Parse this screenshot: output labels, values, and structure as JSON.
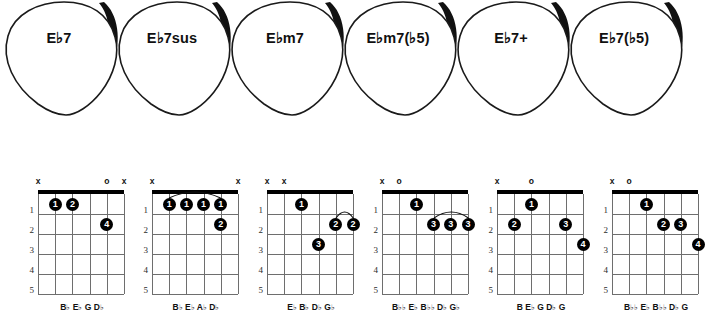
{
  "picks": [
    {
      "name": "pick-eb7",
      "label": "E♭7"
    },
    {
      "name": "pick-eb7sus",
      "label": "E♭7sus"
    },
    {
      "name": "pick-ebm7",
      "label": "E♭m7"
    },
    {
      "name": "pick-ebm7b5",
      "label": "E♭m7(♭5)"
    },
    {
      "name": "pick-eb7aug",
      "label": "E♭7+"
    },
    {
      "name": "pick-eb7b5",
      "label": "E♭7(♭5)"
    }
  ],
  "fret_numbers": [
    "1",
    "2",
    "3",
    "4",
    "5"
  ],
  "diagrams": [
    {
      "name": "chord-diagram-eb7",
      "chord": "E♭7",
      "markers": [
        "x",
        "",
        "",
        "",
        "o",
        "x"
      ],
      "dots": [
        {
          "string": 5,
          "fret": 1,
          "finger": "1"
        },
        {
          "string": 4,
          "fret": 1,
          "finger": "2"
        },
        {
          "string": 2,
          "fret": 2,
          "finger": "4"
        }
      ],
      "barre": null,
      "notes": [
        "B♭",
        "E♭",
        "G",
        "D♭"
      ]
    },
    {
      "name": "chord-diagram-eb7sus",
      "chord": "E♭7sus",
      "markers": [
        "x",
        "",
        "",
        "",
        "",
        "x"
      ],
      "dots": [
        {
          "string": 5,
          "fret": 1,
          "finger": "1"
        },
        {
          "string": 4,
          "fret": 1,
          "finger": "1"
        },
        {
          "string": 3,
          "fret": 1,
          "finger": "1"
        },
        {
          "string": 2,
          "fret": 1,
          "finger": "1"
        },
        {
          "string": 2,
          "fret": 2,
          "finger": "2"
        }
      ],
      "barre": {
        "fret": 1,
        "from_string": 5,
        "to_string": 2
      },
      "notes": [
        "B♭",
        "E♭",
        "A♭",
        "D♭"
      ]
    },
    {
      "name": "chord-diagram-ebm7",
      "chord": "E♭m7",
      "markers": [
        "x",
        "x",
        "",
        "",
        "",
        ""
      ],
      "dots": [
        {
          "string": 4,
          "fret": 1,
          "finger": "1"
        },
        {
          "string": 2,
          "fret": 2,
          "finger": "2"
        },
        {
          "string": 1,
          "fret": 2,
          "finger": "2"
        },
        {
          "string": 3,
          "fret": 3,
          "finger": "3"
        }
      ],
      "barre": {
        "fret": 2,
        "from_string": 2,
        "to_string": 1
      },
      "notes": [
        "E♭",
        "B♭",
        "D♭",
        "G♭"
      ]
    },
    {
      "name": "chord-diagram-ebm7b5",
      "chord": "E♭m7(♭5)",
      "markers": [
        "x",
        "o",
        "",
        "",
        "",
        ""
      ],
      "dots": [
        {
          "string": 4,
          "fret": 1,
          "finger": "1"
        },
        {
          "string": 3,
          "fret": 2,
          "finger": "3"
        },
        {
          "string": 2,
          "fret": 2,
          "finger": "3"
        },
        {
          "string": 1,
          "fret": 2,
          "finger": "3"
        }
      ],
      "barre": {
        "fret": 2,
        "from_string": 3,
        "to_string": 1
      },
      "notes": [
        "B♭♭",
        "E♭",
        "B♭♭",
        "D♭",
        "G♭"
      ]
    },
    {
      "name": "chord-diagram-eb7aug",
      "chord": "E♭7+",
      "markers": [
        "x",
        "",
        "o",
        "",
        "",
        ""
      ],
      "dots": [
        {
          "string": 4,
          "fret": 1,
          "finger": "1"
        },
        {
          "string": 5,
          "fret": 2,
          "finger": "2"
        },
        {
          "string": 2,
          "fret": 2,
          "finger": "3"
        },
        {
          "string": 1,
          "fret": 3,
          "finger": "4"
        }
      ],
      "barre": null,
      "notes": [
        "B",
        "E♭",
        "G",
        "D♭",
        "G"
      ]
    },
    {
      "name": "chord-diagram-eb7b5",
      "chord": "E♭7(♭5)",
      "markers": [
        "x",
        "o",
        "",
        "",
        "",
        ""
      ],
      "dots": [
        {
          "string": 4,
          "fret": 1,
          "finger": "1"
        },
        {
          "string": 3,
          "fret": 2,
          "finger": "2"
        },
        {
          "string": 2,
          "fret": 2,
          "finger": "3"
        },
        {
          "string": 1,
          "fret": 3,
          "finger": "4"
        }
      ],
      "barre": null,
      "notes": [
        "B♭♭",
        "E♭",
        "B♭♭",
        "D♭",
        "G"
      ]
    }
  ],
  "colors": {
    "ink": "#000000",
    "grid": "#6e6e6e",
    "paper": "#ffffff"
  }
}
